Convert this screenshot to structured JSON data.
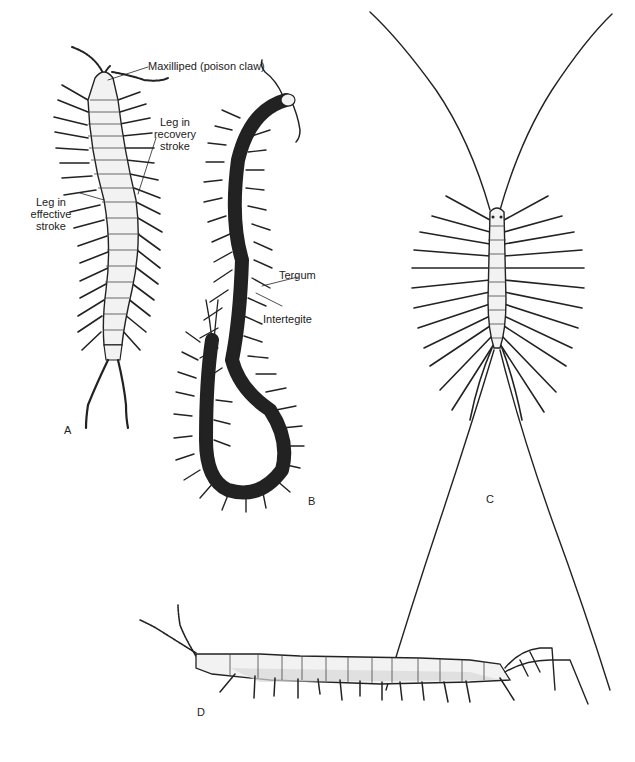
{
  "figure": {
    "panels": [
      {
        "id": "A",
        "label": "A"
      },
      {
        "id": "B",
        "label": "B"
      },
      {
        "id": "C",
        "label": "C"
      },
      {
        "id": "D",
        "label": "D"
      }
    ],
    "annotations": {
      "maxilliped": "Maxilliped (poison claw)",
      "recovery_l1": "Leg in",
      "recovery_l2": "recovery",
      "recovery_l3": "stroke",
      "effective_l1": "Leg in",
      "effective_l2": "effective",
      "effective_l3": "stroke",
      "tergum": "Tergum",
      "intertegite": "Intertegite"
    },
    "colors": {
      "ink": "#222222",
      "body_fill": "#f2f2f2",
      "shade": "#d8d8d8",
      "background": "#ffffff"
    }
  }
}
